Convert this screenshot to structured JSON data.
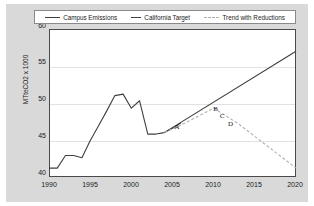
{
  "chart_data": {
    "type": "line",
    "title": "",
    "xlabel": "",
    "ylabel": "MTteCO2 x 1000",
    "xlim": [
      1990,
      2020
    ],
    "ylim": [
      40,
      60
    ],
    "yticks": [
      40,
      45,
      50,
      55,
      60
    ],
    "xticks": [
      1990,
      1995,
      2000,
      2005,
      2010,
      2015,
      2020
    ],
    "grid": "horizontal",
    "legend_position": "top",
    "series": [
      {
        "name": "Campus Emissions",
        "style": "solid",
        "color": "#3f3f3f",
        "x": [
          1990,
          1991,
          1992,
          1993,
          1994,
          1995,
          1996,
          1997,
          1998,
          1999,
          2000,
          2001,
          2002,
          2003,
          2004,
          2005,
          2006
        ],
        "values": [
          41.2,
          41.2,
          42.9,
          42.9,
          42.6,
          44.9,
          46.9,
          48.9,
          51.0,
          51.2,
          49.3,
          50.3,
          45.8,
          45.8,
          46.0,
          46.6,
          47.3
        ]
      },
      {
        "name": "California Target",
        "style": "solid",
        "color": "#3f3f3f",
        "x": [
          2004,
          2020
        ],
        "values": [
          46.0,
          57.0
        ]
      },
      {
        "name": "Trend with Reductions",
        "style": "dashed",
        "color": "#b0b0b0",
        "x": [
          2004,
          2006,
          2010,
          2011,
          2012,
          2013,
          2020
        ],
        "values": [
          46.0,
          47.0,
          49.3,
          48.6,
          47.9,
          47.2,
          41.2
        ]
      }
    ],
    "annotations": [
      {
        "label": "A",
        "x": 2005.6,
        "y": 46.7
      },
      {
        "label": "B",
        "x": 2010.3,
        "y": 49.2
      },
      {
        "label": "C",
        "x": 2011.1,
        "y": 48.2
      },
      {
        "label": "D",
        "x": 2012.1,
        "y": 47.1
      }
    ]
  },
  "legend": {
    "items": [
      {
        "label": "Campus Emissions",
        "color": "#3f3f3f",
        "dash": "solid"
      },
      {
        "label": "California Target",
        "color": "#3f3f3f",
        "dash": "solid"
      },
      {
        "label": "Trend with Reductions",
        "color": "#b0b0b0",
        "dash": "dashed"
      }
    ]
  },
  "axes": {
    "y_title": "MTteCO2 x 1000",
    "y_ticks": [
      "60",
      "55",
      "50",
      "45",
      "40"
    ],
    "x_ticks": [
      "1990",
      "1995",
      "2000",
      "2005",
      "2010",
      "2015",
      "2020"
    ]
  }
}
